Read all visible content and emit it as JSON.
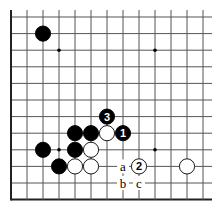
{
  "diagram": {
    "type": "go-board-fragment",
    "grid": {
      "columns": 13,
      "rows": 12,
      "origin_x": 11,
      "origin_y": 17,
      "spacing_x": 16,
      "spacing_y": 16.6,
      "open_top": true,
      "open_right": true,
      "left_edge": true,
      "bottom_edge": true
    },
    "star_points": [
      {
        "col": 3,
        "row": 2
      },
      {
        "col": 9,
        "row": 2
      },
      {
        "col": 3,
        "row": 8
      },
      {
        "col": 9,
        "row": 8
      }
    ],
    "stones": [
      {
        "color": "black",
        "col": 2,
        "row": 1,
        "label": ""
      },
      {
        "color": "black",
        "col": 6,
        "row": 6,
        "label": "3"
      },
      {
        "color": "black",
        "col": 4,
        "row": 7,
        "label": ""
      },
      {
        "color": "black",
        "col": 5,
        "row": 7,
        "label": ""
      },
      {
        "color": "white",
        "col": 6,
        "row": 7,
        "label": ""
      },
      {
        "color": "black",
        "col": 7,
        "row": 7,
        "label": "1"
      },
      {
        "color": "black",
        "col": 2,
        "row": 8,
        "label": ""
      },
      {
        "color": "black",
        "col": 4,
        "row": 8,
        "label": ""
      },
      {
        "color": "white",
        "col": 5,
        "row": 8,
        "label": ""
      },
      {
        "color": "black",
        "col": 3,
        "row": 9,
        "label": ""
      },
      {
        "color": "white",
        "col": 4,
        "row": 9,
        "label": ""
      },
      {
        "color": "white",
        "col": 5,
        "row": 9,
        "label": ""
      },
      {
        "color": "white",
        "col": 8,
        "row": 9,
        "label": "2"
      },
      {
        "color": "white",
        "col": 11,
        "row": 9,
        "label": ""
      }
    ],
    "point_labels": [
      {
        "text": "a",
        "col": 7,
        "row": 9
      },
      {
        "text": "b",
        "col": 7,
        "row": 10
      },
      {
        "text": "c",
        "col": 8,
        "row": 10
      }
    ],
    "colors": {
      "line": "#555555",
      "edge": "#222222",
      "black_stone": "#000000",
      "white_stone": "#ffffff"
    }
  }
}
